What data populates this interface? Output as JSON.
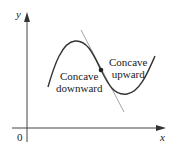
{
  "diagram": {
    "axes": {
      "x_label": "x",
      "y_label": "y",
      "origin_label": "0"
    },
    "regions": [
      {
        "id": "downward",
        "line1": "Concave",
        "line2": "downward"
      },
      {
        "id": "upward",
        "line1": "Concave",
        "line2": "upward"
      }
    ],
    "elements": {
      "curve": "cubic-s-curve",
      "tangent_line": "tangent-at-inflection-point",
      "inflection_point": "dot"
    },
    "colors": {
      "axis": "#333333",
      "curve": "#333333",
      "tangent": "#999999",
      "text": "#222222"
    }
  }
}
